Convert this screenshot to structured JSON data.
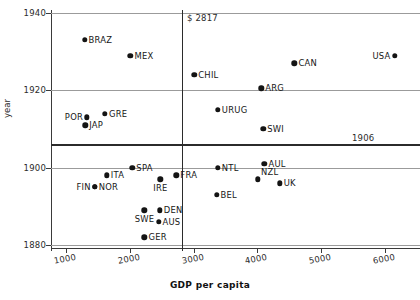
{
  "chart_data": {
    "type": "scatter",
    "title": "",
    "xlabel": "GDP per capita",
    "ylabel": "year",
    "xlim": [
      800,
      6300
    ],
    "ylim": [
      1875,
      1943
    ],
    "grid": true,
    "legend": "none",
    "xticks": [
      1000,
      2000,
      3000,
      4000,
      5000,
      6000
    ],
    "xtick_labels": [
      "1000",
      "2000",
      "3000",
      "4000",
      "5000",
      "6000"
    ],
    "yticks": [
      1880,
      1900,
      1920,
      1940
    ],
    "ytick_labels": [
      "1880",
      "1900",
      "1920",
      "1940"
    ],
    "annotations": [
      {
        "name": "gdp-threshold",
        "text": "$ 2817",
        "value": 2817,
        "axis": "x"
      },
      {
        "name": "year-threshold",
        "text": "1906",
        "value": 1906,
        "axis": "y"
      }
    ],
    "reference_lines": [
      {
        "name": "vertical-gdp-line",
        "orientation": "vertical",
        "value": 2817
      },
      {
        "name": "horizontal-year-line",
        "orientation": "horizontal",
        "value": 1906
      }
    ],
    "points": [
      {
        "label": "BRAZ",
        "x": 1290,
        "y": 1933,
        "label_pos": "right"
      },
      {
        "label": "MEX",
        "x": 2010,
        "y": 1929,
        "label_pos": "right"
      },
      {
        "label": "USA",
        "x": 6150,
        "y": 1929,
        "label_pos": "left"
      },
      {
        "label": "CAN",
        "x": 4580,
        "y": 1927,
        "label_pos": "right"
      },
      {
        "label": "CHIL",
        "x": 3010,
        "y": 1924,
        "label_pos": "right"
      },
      {
        "label": "ARG",
        "x": 4060,
        "y": 1920.5,
        "label_pos": "right"
      },
      {
        "label": "URUG",
        "x": 3380,
        "y": 1915,
        "label_pos": "right"
      },
      {
        "label": "GRE",
        "x": 1610,
        "y": 1914,
        "label_pos": "right"
      },
      {
        "label": "POR",
        "x": 1330,
        "y": 1913,
        "label_pos": "left"
      },
      {
        "label": "JAP",
        "x": 1300,
        "y": 1911,
        "label_pos": "right"
      },
      {
        "label": "SWI",
        "x": 4090,
        "y": 1910,
        "label_pos": "right"
      },
      {
        "label": "AUL",
        "x": 4110,
        "y": 1901,
        "label_pos": "right"
      },
      {
        "label": "SPA",
        "x": 2040,
        "y": 1900,
        "label_pos": "right"
      },
      {
        "label": "NTL",
        "x": 3380,
        "y": 1900,
        "label_pos": "right"
      },
      {
        "label": "ITA",
        "x": 1640,
        "y": 1898,
        "label_pos": "right"
      },
      {
        "label": "FRA",
        "x": 2730,
        "y": 1898,
        "label_pos": "right"
      },
      {
        "label": "NZL",
        "x": 4010,
        "y": 1897,
        "label_pos": "above-right"
      },
      {
        "label": "IRE",
        "x": 2480,
        "y": 1897,
        "label_pos": "below"
      },
      {
        "label": "UK",
        "x": 4350,
        "y": 1896,
        "label_pos": "right"
      },
      {
        "label": "NOR",
        "x": 1450,
        "y": 1895,
        "label_pos": "right"
      },
      {
        "label": "FIN",
        "x": 1450,
        "y": 1895,
        "label_pos": "left"
      },
      {
        "label": "BEL",
        "x": 3360,
        "y": 1893,
        "label_pos": "right"
      },
      {
        "label": "DEN",
        "x": 2470,
        "y": 1889,
        "label_pos": "right"
      },
      {
        "label": "SWE",
        "x": 2230,
        "y": 1889,
        "label_pos": "below"
      },
      {
        "label": "AUS",
        "x": 2450,
        "y": 1886,
        "label_pos": "right"
      },
      {
        "label": "GER",
        "x": 2230,
        "y": 1882,
        "label_pos": "right"
      }
    ]
  }
}
